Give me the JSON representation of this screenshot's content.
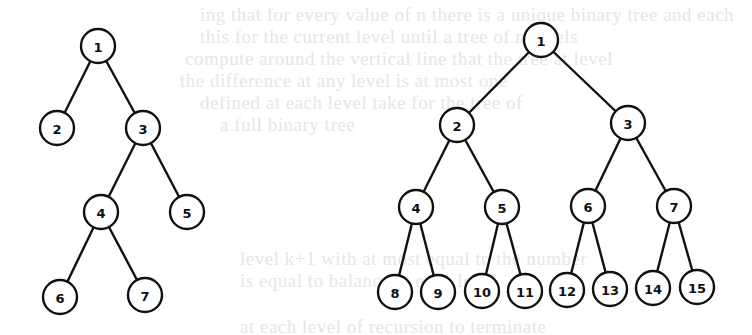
{
  "background_text": [
    {
      "text": "ing that for every value of n there is a unique binary tree and each",
      "x": 200,
      "y": 4
    },
    {
      "text": "this for the current level until a tree of n levels",
      "x": 200,
      "y": 26
    },
    {
      "text": "compute around the vertical line that the tree at level",
      "x": 185,
      "y": 48
    },
    {
      "text": "the difference at any level is at most one",
      "x": 180,
      "y": 70
    },
    {
      "text": "defined at each level take for the tree of",
      "x": 200,
      "y": 92
    },
    {
      "text": "a full binary tree",
      "x": 220,
      "y": 114
    },
    {
      "text": "level k+1 with at most equal to the number",
      "x": 240,
      "y": 248
    },
    {
      "text": "is equal to balance at each level",
      "x": 240,
      "y": 270
    },
    {
      "text": "at each level of recursion to terminate",
      "x": 240,
      "y": 316
    }
  ],
  "trees": [
    {
      "name": "left-tree",
      "nodes": [
        {
          "id": "1",
          "x": 98,
          "y": 46
        },
        {
          "id": "2",
          "x": 57,
          "y": 128
        },
        {
          "id": "3",
          "x": 143,
          "y": 128
        },
        {
          "id": "4",
          "x": 101,
          "y": 212
        },
        {
          "id": "5",
          "x": 187,
          "y": 212
        },
        {
          "id": "6",
          "x": 60,
          "y": 297
        },
        {
          "id": "7",
          "x": 145,
          "y": 295
        }
      ],
      "edges": [
        [
          "1",
          "2"
        ],
        [
          "1",
          "3"
        ],
        [
          "3",
          "4"
        ],
        [
          "3",
          "5"
        ],
        [
          "4",
          "6"
        ],
        [
          "4",
          "7"
        ]
      ]
    },
    {
      "name": "right-tree",
      "nodes": [
        {
          "id": "1",
          "x": 541,
          "y": 40
        },
        {
          "id": "2",
          "x": 457,
          "y": 125
        },
        {
          "id": "3",
          "x": 628,
          "y": 123
        },
        {
          "id": "4",
          "x": 416,
          "y": 207
        },
        {
          "id": "5",
          "x": 502,
          "y": 207
        },
        {
          "id": "6",
          "x": 588,
          "y": 206
        },
        {
          "id": "7",
          "x": 674,
          "y": 206
        },
        {
          "id": "8",
          "x": 395,
          "y": 292
        },
        {
          "id": "9",
          "x": 438,
          "y": 292
        },
        {
          "id": "10",
          "x": 482,
          "y": 291
        },
        {
          "id": "11",
          "x": 525,
          "y": 291
        },
        {
          "id": "12",
          "x": 567,
          "y": 290
        },
        {
          "id": "13",
          "x": 610,
          "y": 289
        },
        {
          "id": "14",
          "x": 653,
          "y": 288
        },
        {
          "id": "15",
          "x": 697,
          "y": 287
        }
      ],
      "edges": [
        [
          "1",
          "2"
        ],
        [
          "1",
          "3"
        ],
        [
          "2",
          "4"
        ],
        [
          "2",
          "5"
        ],
        [
          "3",
          "6"
        ],
        [
          "3",
          "7"
        ],
        [
          "4",
          "8"
        ],
        [
          "4",
          "9"
        ],
        [
          "5",
          "10"
        ],
        [
          "5",
          "11"
        ],
        [
          "6",
          "12"
        ],
        [
          "6",
          "13"
        ],
        [
          "7",
          "14"
        ],
        [
          "7",
          "15"
        ]
      ]
    }
  ],
  "style": {
    "node_radius": 17,
    "stroke": "#111111",
    "background": "#ffffff"
  }
}
